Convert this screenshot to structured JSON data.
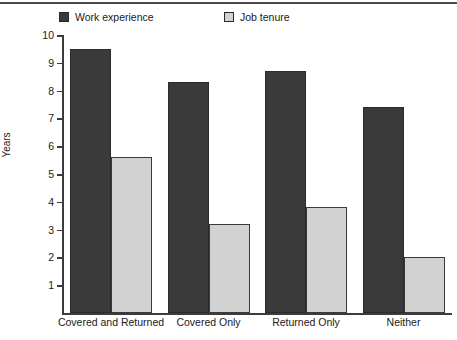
{
  "chart_data": {
    "type": "bar",
    "title": "",
    "xlabel": "",
    "ylabel": "Years",
    "categories": [
      "Covered and Returned",
      "Covered Only",
      "Returned Only",
      "Neither"
    ],
    "series": [
      {
        "name": "Work experience",
        "color": "#3a3a3a",
        "values": [
          9.5,
          8.3,
          8.7,
          7.4
        ]
      },
      {
        "name": "Job tenure",
        "color": "#d2d2d2",
        "values": [
          5.6,
          3.2,
          3.8,
          2.0
        ]
      }
    ],
    "ylim": [
      0,
      10
    ],
    "yticks": [
      1,
      2,
      3,
      4,
      5,
      6,
      7,
      8,
      9,
      10
    ],
    "ytick_labels": [
      "1",
      "2",
      "3",
      "4",
      "5",
      "6",
      "7",
      "8",
      "9",
      "10"
    ],
    "grid": false,
    "legend_position": "top"
  },
  "legend": {
    "items": [
      {
        "label": "Work experience",
        "swatch": "dark-square-icon"
      },
      {
        "label": "Job tenure",
        "swatch": "light-square-icon"
      }
    ]
  },
  "axis": {
    "y_title": "Years"
  }
}
